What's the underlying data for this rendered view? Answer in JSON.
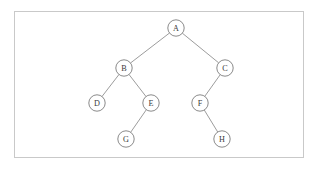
{
  "figure": {
    "frame": {
      "x": 14,
      "y": 11,
      "width": 290,
      "height": 147,
      "border_color": "#c9c9c9",
      "background_color": "#ffffff"
    },
    "style": {
      "node_fill": "#ffffff",
      "node_stroke": "#7d7d7d",
      "edge_stroke": "#8a8a8a",
      "label_color": "#3a3a3a",
      "node_radius": 8.2
    }
  },
  "chart_data": {
    "type": "diagram",
    "diagram_kind": "binary-tree",
    "nodes": [
      {
        "id": "A",
        "label": "A",
        "x": 176,
        "y": 28,
        "depth": 0
      },
      {
        "id": "B",
        "label": "B",
        "x": 124,
        "y": 68,
        "depth": 1
      },
      {
        "id": "C",
        "label": "C",
        "x": 225,
        "y": 68,
        "depth": 1
      },
      {
        "id": "D",
        "label": "D",
        "x": 97,
        "y": 103,
        "depth": 2
      },
      {
        "id": "E",
        "label": "E",
        "x": 151,
        "y": 103,
        "depth": 2
      },
      {
        "id": "F",
        "label": "F",
        "x": 200,
        "y": 103,
        "depth": 2
      },
      {
        "id": "G",
        "label": "G",
        "x": 126,
        "y": 139,
        "depth": 3
      },
      {
        "id": "H",
        "label": "H",
        "x": 222,
        "y": 139,
        "depth": 3
      }
    ],
    "edges": [
      {
        "from": "A",
        "to": "B",
        "side": "left"
      },
      {
        "from": "A",
        "to": "C",
        "side": "right"
      },
      {
        "from": "B",
        "to": "D",
        "side": "left"
      },
      {
        "from": "B",
        "to": "E",
        "side": "right"
      },
      {
        "from": "C",
        "to": "F",
        "side": "left"
      },
      {
        "from": "E",
        "to": "G",
        "side": "left"
      },
      {
        "from": "F",
        "to": "H",
        "side": "right"
      }
    ],
    "root": "A",
    "leaves": [
      "D",
      "G",
      "H"
    ],
    "node_count": 8,
    "edge_count": 7,
    "height": 3
  }
}
